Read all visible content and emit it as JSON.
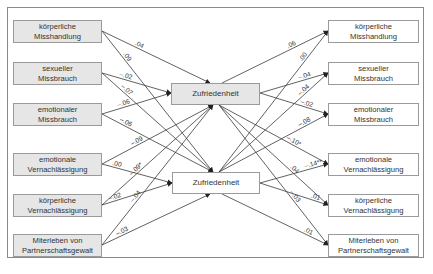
{
  "diagram": {
    "type": "path-model",
    "left_column": {
      "fill": "#e6e6e6",
      "items": [
        {
          "label": "körperliche\nMisshandlung",
          "to_top": ".04",
          "to_bottom": ".09"
        },
        {
          "label": "sexueller\nMissbrauch",
          "to_top": "–.02",
          "to_bottom": "–.07"
        },
        {
          "label": "emotionaler\nMissbrauch",
          "to_top": "–.06",
          "to_bottom": "–.06"
        },
        {
          "label": "emotionale\nVernachlässigung",
          "to_top": "–.09",
          "to_bottom": ".00"
        },
        {
          "label": "körperliche\nVernachlässigung",
          "to_top": "–.09*",
          "to_bottom": "–.02"
        },
        {
          "label": "Miterleben von\nPartnerschaftsgewalt",
          "to_top": "–.04",
          "to_bottom": "–.03"
        }
      ]
    },
    "center": {
      "top": {
        "label": "Zufriedenheit",
        "fill": "#e6e6e6"
      },
      "bottom": {
        "label": "Zufriedenheit",
        "fill": "#ffffff"
      }
    },
    "right_column": {
      "fill": "#ffffff",
      "items": [
        {
          "label": "körperliche\nMisshandlung",
          "from_top": ".06",
          "from_bottom": ".00"
        },
        {
          "label": "sexueller\nMissbrauch",
          "from_top": "–.04",
          "from_bottom": "–.04"
        },
        {
          "label": "emotionaler\nMissbrauch",
          "from_top": "–.02",
          "from_bottom": "–.08"
        },
        {
          "label": "emotionale\nVernachlässigung",
          "from_top": "–.10*",
          "from_bottom": "–.14**"
        },
        {
          "label": "körperliche\nVernachlässigung",
          "from_top": ".04",
          "from_bottom": ".01"
        },
        {
          "label": "Miterleben von\nPartnerschaftsgewalt",
          "from_top": "–.03",
          "from_bottom": ".01"
        }
      ]
    },
    "colors": {
      "line": "#3a3a3a",
      "border": "#9a9a9a",
      "gray_fill": "#e6e6e6",
      "frame": "#8a8a8a"
    }
  }
}
